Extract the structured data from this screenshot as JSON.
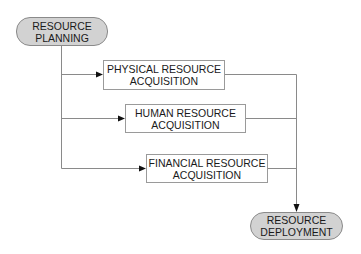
{
  "diagram": {
    "type": "flowchart",
    "colors": {
      "pill_fill": "#d2d2d2",
      "pill_border": "#8a8a8a",
      "box_border": "#9a9a9a",
      "line": "#8a8a8a",
      "arrow": "#111111",
      "text": "#1a1a1a"
    },
    "nodes": {
      "start": {
        "shape": "rounded-pill",
        "line1": "RESOURCE",
        "line2": "PLANNING"
      },
      "physical": {
        "shape": "rectangle",
        "line1": "PHYSICAL RESOURCE",
        "line2": "ACQUISITION"
      },
      "human": {
        "shape": "rectangle",
        "line1": "HUMAN RESOURCE",
        "line2": "ACQUISITION"
      },
      "financial": {
        "shape": "rectangle",
        "line1": "FINANCIAL RESOURCE",
        "line2": "ACQUISITION"
      },
      "end": {
        "shape": "rounded-pill",
        "line1": "RESOURCE",
        "line2": "DEPLOYMENT"
      }
    },
    "edges": [
      {
        "from": "RESOURCE PLANNING",
        "to": "PHYSICAL RESOURCE ACQUISITION"
      },
      {
        "from": "RESOURCE PLANNING",
        "to": "HUMAN RESOURCE ACQUISITION"
      },
      {
        "from": "RESOURCE PLANNING",
        "to": "FINANCIAL RESOURCE ACQUISITION"
      },
      {
        "from": "PHYSICAL RESOURCE ACQUISITION",
        "to": "RESOURCE DEPLOYMENT"
      },
      {
        "from": "HUMAN RESOURCE ACQUISITION",
        "to": "RESOURCE DEPLOYMENT"
      },
      {
        "from": "FINANCIAL RESOURCE ACQUISITION",
        "to": "RESOURCE DEPLOYMENT"
      }
    ]
  }
}
